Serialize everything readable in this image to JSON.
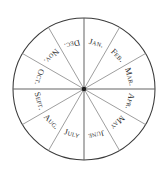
{
  "figure": {
    "shape": "circle",
    "background_color": "#ffffff",
    "outline_color": "#3a3a3a",
    "spoke_color": "#8d8d8d",
    "axis_color": "#5c5c5c",
    "hub_color": "#1d1d1d",
    "label_color": "#2b2b2b"
  },
  "chart_data": {
    "type": "pie",
    "title": "",
    "subtitle": "",
    "xlabel": "",
    "ylabel": "",
    "legend_position": "none",
    "grid": false,
    "equal_slices": true,
    "slice_count": 12,
    "slice_degrees": 30,
    "start_angle_deg": 0,
    "direction": "clockwise",
    "center_px": [
      84,
      89
    ],
    "radius_px": 71,
    "categories": [
      "Jan.",
      "Feb.",
      "Mar.",
      "Apr.",
      "May",
      "June",
      "July",
      "Aug.",
      "Sept.",
      "Oct.",
      "Nov.",
      "Dec."
    ],
    "values": [
      8.333,
      8.333,
      8.333,
      8.333,
      8.333,
      8.333,
      8.333,
      8.333,
      8.333,
      8.333,
      8.333,
      8.333
    ],
    "value_unit": "percent",
    "slices": [
      {
        "label": "Jan.",
        "mid_angle_deg": 15,
        "text_rotation_deg": 15,
        "value": 8.333
      },
      {
        "label": "Feb.",
        "mid_angle_deg": 45,
        "text_rotation_deg": 45,
        "value": 8.333
      },
      {
        "label": "Mar.",
        "mid_angle_deg": 75,
        "text_rotation_deg": 75,
        "value": 8.333
      },
      {
        "label": "Apr.",
        "mid_angle_deg": 105,
        "text_rotation_deg": 105,
        "value": 8.333
      },
      {
        "label": "May",
        "mid_angle_deg": 135,
        "text_rotation_deg": 135,
        "value": 8.333
      },
      {
        "label": "June",
        "mid_angle_deg": 165,
        "text_rotation_deg": 165,
        "value": 8.333
      },
      {
        "label": "July",
        "mid_angle_deg": 195,
        "text_rotation_deg": 15,
        "value": 8.333
      },
      {
        "label": "Aug.",
        "mid_angle_deg": 225,
        "text_rotation_deg": 45,
        "value": 8.333
      },
      {
        "label": "Sept.",
        "mid_angle_deg": 255,
        "text_rotation_deg": 75,
        "value": 8.333
      },
      {
        "label": "Oct.",
        "mid_angle_deg": 285,
        "text_rotation_deg": 105,
        "value": 8.333
      },
      {
        "label": "Nov.",
        "mid_angle_deg": 315,
        "text_rotation_deg": 135,
        "value": 8.333
      },
      {
        "label": "Dec.",
        "mid_angle_deg": 345,
        "text_rotation_deg": 165,
        "value": 8.333
      }
    ],
    "annotations": []
  }
}
